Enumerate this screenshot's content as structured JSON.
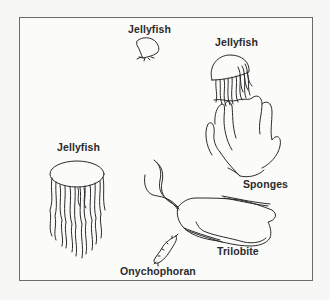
{
  "figure": {
    "labels": {
      "jellyfish_top": "Jellyfish",
      "jellyfish_right": "Jellyfish",
      "sponges": "Sponges",
      "jellyfish_left": "Jellyfish",
      "trilobite": "Trilobite",
      "onychophoran": "Onychophoran"
    },
    "icons": [
      "jellyfish-small-drawing",
      "jellyfish-large-drawing",
      "sponges-drawing",
      "jellyfish-left-drawing",
      "trilobite-drawing",
      "onychophoran-drawing"
    ],
    "colors": {
      "line": "#2b2b2b",
      "frame": "#6b6b6b",
      "background": "#fbfbfa"
    }
  }
}
